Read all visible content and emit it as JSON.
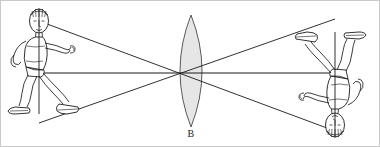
{
  "figure": {
    "type": "optics-ray-diagram",
    "background_color": "#ffffff",
    "border_color": "#c9c9c9",
    "stroke_color": "#1a1a1a",
    "lens": {
      "label": "B",
      "kind": "biconvex-converging-lens",
      "fill_color": "#e6e6e6",
      "outline_color": "#5a5a5a",
      "center_x": 190,
      "top_y": 14,
      "bottom_y": 126,
      "half_width": 22
    },
    "optical_axis": {
      "y": 72,
      "x_start": 38,
      "x_end": 334
    },
    "focal_point": {
      "x": 190,
      "y": 72
    },
    "object": {
      "name": "person-upright",
      "orientation": "upright",
      "x": 38,
      "head_y": 20,
      "feet_y": 122,
      "description": "standing person leaning forward, arms bent, wearing shoes"
    },
    "image": {
      "name": "person-inverted",
      "orientation": "inverted",
      "x": 334,
      "feet_y": 18,
      "head_y": 130,
      "description": "same person rendered upside down as the real image"
    },
    "rays": [
      {
        "name": "ray-top",
        "from_x": 38,
        "from_y": 20,
        "to_x": 334,
        "to_y": 130
      },
      {
        "name": "ray-axis",
        "from_x": 38,
        "from_y": 72,
        "to_x": 334,
        "to_y": 72
      },
      {
        "name": "ray-bottom",
        "from_x": 38,
        "from_y": 122,
        "to_x": 334,
        "to_y": 18
      }
    ]
  }
}
